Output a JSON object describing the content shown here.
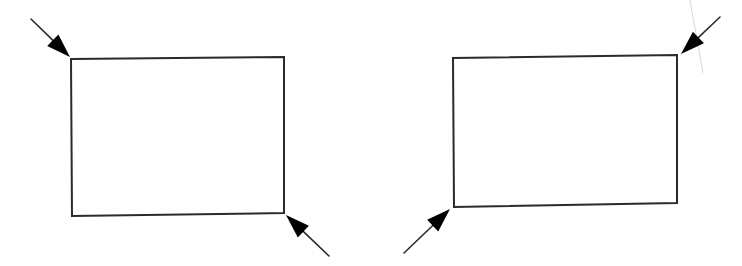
{
  "diagram": {
    "colors": {
      "stroke": "#2b2b2b",
      "arrowhead": "#000000",
      "background": "#ffffff",
      "faint_line": "#d9d9d9"
    },
    "figures": [
      {
        "id": "left",
        "rectangle": {
          "points": [
            [
              71,
              59
            ],
            [
              284,
              57
            ],
            [
              284,
              213
            ],
            [
              72,
              216
            ]
          ]
        },
        "arrows": [
          {
            "target_corner": "top-left",
            "from": [
              31,
              19
            ],
            "tip": [
              70,
              57
            ]
          },
          {
            "target_corner": "bottom-right",
            "from": [
              329,
              256
            ],
            "tip": [
              286,
              215
            ]
          }
        ]
      },
      {
        "id": "right",
        "rectangle": {
          "points": [
            [
              453,
              58
            ],
            [
              677,
              55
            ],
            [
              677,
              203
            ],
            [
              454,
              207
            ]
          ]
        },
        "arrows": [
          {
            "target_corner": "top-right",
            "from": [
              720,
              17
            ],
            "tip": [
              681,
              54
            ]
          },
          {
            "target_corner": "bottom-left",
            "from": [
              404,
              253
            ],
            "tip": [
              450,
              209
            ]
          }
        ]
      }
    ],
    "artifacts": [
      {
        "type": "faint-line",
        "from": [
          690,
          0
        ],
        "to": [
          703,
          73
        ]
      }
    ]
  }
}
